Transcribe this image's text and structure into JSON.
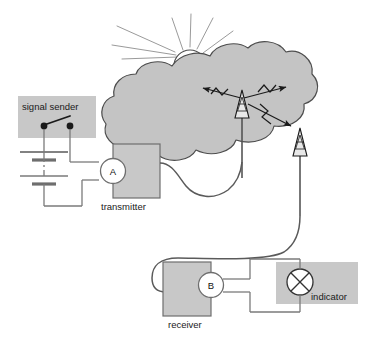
{
  "diagram": {
    "background_color": "#ffffff",
    "colors": {
      "box_fill": "#c8c8c8",
      "box_stroke": "#6e6e6e",
      "cloud_fill": "#c4c4c4",
      "cloud_stroke": "#4d4d4d",
      "wire": "#7a7a7a",
      "cable": "#5a5a5a",
      "ink": "#1a1a1a",
      "meter_fill": "#ffffff",
      "sun_stroke": "#9a9a9a"
    },
    "labels": {
      "signal_sender": "signal sender",
      "transmitter": "transmitter",
      "receiver": "receiver",
      "indicator": "indicator",
      "meter_a": "A",
      "meter_b": "B"
    },
    "components": [
      {
        "id": "signal-sender",
        "label": "signal sender",
        "kind": "shaded-panel",
        "contains": "telegraph-key-switch"
      },
      {
        "id": "battery",
        "label": "",
        "kind": "battery-stack",
        "cells": 2,
        "dashed_continuation": true
      },
      {
        "id": "meter-a",
        "label": "A",
        "kind": "meter"
      },
      {
        "id": "transmitter",
        "label": "transmitter",
        "kind": "shaded-box"
      },
      {
        "id": "antenna-transmit",
        "label": "",
        "kind": "lattice-tower"
      },
      {
        "id": "antenna-receive",
        "label": "",
        "kind": "lattice-tower"
      },
      {
        "id": "cloud",
        "label": "",
        "kind": "cloud"
      },
      {
        "id": "sun",
        "label": "",
        "kind": "sun-behind-cloud",
        "rays": 7
      },
      {
        "id": "receiver",
        "label": "receiver",
        "kind": "shaded-box"
      },
      {
        "id": "meter-b",
        "label": "B",
        "kind": "meter"
      },
      {
        "id": "indicator",
        "label": "indicator",
        "kind": "lamp-symbol"
      }
    ],
    "wave_arrows": [
      {
        "from": "antenna-transmit",
        "direction": "up-left",
        "double_headed": false
      },
      {
        "from": "antenna-transmit",
        "direction": "up-right",
        "double_headed": false
      },
      {
        "from": "antenna-transmit",
        "direction": "down-right-to-antenna-receive",
        "double_headed": false
      }
    ]
  }
}
